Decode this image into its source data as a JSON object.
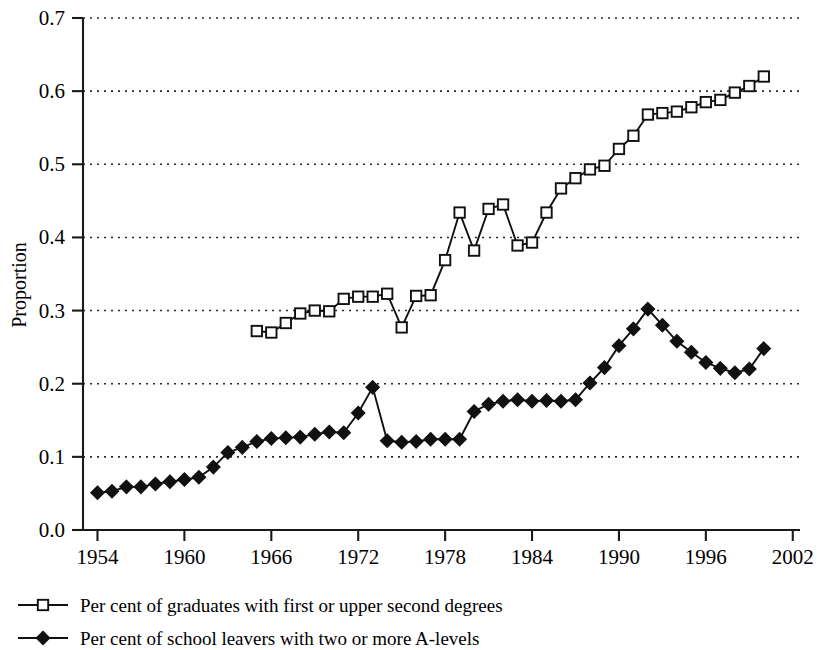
{
  "chart_data": {
    "type": "line",
    "title": "",
    "xlabel": "",
    "ylabel": "Proportion",
    "xlim": [
      1953,
      2002.5
    ],
    "ylim": [
      0.0,
      0.7
    ],
    "grid": true,
    "legend_position": "below",
    "x_ticks": [
      "1954",
      "1960",
      "1966",
      "1972",
      "1978",
      "1984",
      "1990",
      "1996",
      "2002"
    ],
    "x_tick_values": [
      1954,
      1960,
      1966,
      1972,
      1978,
      1984,
      1990,
      1996,
      2002
    ],
    "y_ticks": [
      "0.0",
      "0.1",
      "0.2",
      "0.3",
      "0.4",
      "0.5",
      "0.6",
      "0.7"
    ],
    "y_tick_values": [
      0.0,
      0.1,
      0.2,
      0.3,
      0.4,
      0.5,
      0.6,
      0.7
    ],
    "series": [
      {
        "name": "Per cent of graduates with first or upper second degrees",
        "marker": "open-square",
        "x": [
          1965,
          1966,
          1967,
          1968,
          1969,
          1970,
          1971,
          1972,
          1973,
          1974,
          1975,
          1976,
          1977,
          1978,
          1979,
          1980,
          1981,
          1982,
          1983,
          1984,
          1985,
          1986,
          1987,
          1988,
          1989,
          1990,
          1991,
          1992,
          1993,
          1994,
          1995,
          1996,
          1997,
          1998,
          1999,
          2000
        ],
        "values": [
          0.272,
          0.27,
          0.283,
          0.296,
          0.3,
          0.299,
          0.316,
          0.319,
          0.319,
          0.323,
          0.277,
          0.32,
          0.321,
          0.369,
          0.434,
          0.382,
          0.439,
          0.445,
          0.389,
          0.393,
          0.434,
          0.467,
          0.481,
          0.493,
          0.498,
          0.521,
          0.539,
          0.568,
          0.57,
          0.572,
          0.578,
          0.585,
          0.588,
          0.598,
          0.607,
          0.62
        ]
      },
      {
        "name": "Per cent of school leavers with two or more A-levels",
        "marker": "filled-diamond",
        "x": [
          1954,
          1955,
          1956,
          1957,
          1958,
          1959,
          1960,
          1961,
          1962,
          1963,
          1964,
          1965,
          1966,
          1967,
          1968,
          1969,
          1970,
          1971,
          1972,
          1973,
          1974,
          1975,
          1976,
          1977,
          1978,
          1979,
          1980,
          1981,
          1982,
          1983,
          1984,
          1985,
          1986,
          1987,
          1988,
          1989,
          1990,
          1991,
          1992,
          1993,
          1994,
          1995,
          1996,
          1997,
          1998,
          1999,
          2000
        ],
        "values": [
          0.051,
          0.053,
          0.059,
          0.059,
          0.063,
          0.066,
          0.069,
          0.072,
          0.086,
          0.106,
          0.113,
          0.121,
          0.125,
          0.126,
          0.127,
          0.131,
          0.134,
          0.133,
          0.16,
          0.195,
          0.122,
          0.12,
          0.121,
          0.124,
          0.124,
          0.124,
          0.162,
          0.172,
          0.176,
          0.178,
          0.176,
          0.177,
          0.176,
          0.178,
          0.201,
          0.222,
          0.252,
          0.275,
          0.302,
          0.28,
          0.258,
          0.243,
          0.229,
          0.221,
          0.215,
          0.22,
          0.248
        ]
      }
    ]
  },
  "legend": {
    "items": [
      {
        "label": "Per cent of graduates with first or upper second degrees",
        "marker": "open-square"
      },
      {
        "label": "Per cent of school leavers with two or more A-levels",
        "marker": "filled-diamond"
      }
    ]
  },
  "axis": {
    "y_title": "Proportion"
  },
  "colors": {
    "ink": "#111111",
    "grid": "#2a2a2a",
    "background": "#ffffff"
  }
}
